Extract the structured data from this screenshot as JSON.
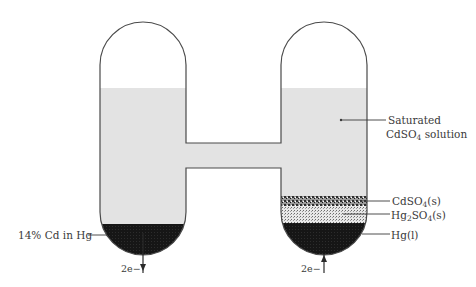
{
  "diagram": {
    "colors": {
      "outline": "#4a4a4a",
      "solution": "#e3e3e3",
      "amalgam": "#1e1e1e",
      "mercury": "#141414",
      "cdso4_solid": "#4a4a4a",
      "hg2so4_solid": "#c8c8c8",
      "text": "#3a3a3a"
    },
    "labels": {
      "saturated_line1": "Saturated",
      "saturated_line2_main": "CdSO",
      "saturated_line2_sub": "4",
      "saturated_line2_rest": " solution",
      "cdso4_main": "CdSO",
      "cdso4_sub": "4",
      "cdso4_rest": "(s)",
      "hg2so4_a": "Hg",
      "hg2so4_sub1": "2",
      "hg2so4_b": "SO",
      "hg2so4_sub2": "4",
      "hg2so4_rest": "(s)",
      "hg_liquid": "Hg(l)",
      "amalgam": "14% Cd in Hg",
      "electron_left": "2e−",
      "electron_right": "2e−"
    },
    "electron_flow": {
      "left": "out (down)",
      "right": "in (up)"
    }
  }
}
